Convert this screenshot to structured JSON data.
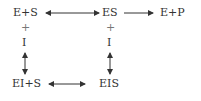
{
  "diagram": {
    "type": "enzyme inhibition reaction scheme",
    "nodes": {
      "e_plus_s": "E+S",
      "es": "ES",
      "e_plus_p": "E+P",
      "ei_plus_s": "EI+S",
      "eis": "EIS"
    },
    "left_column": {
      "plus": "+",
      "inhibitor": "I"
    },
    "right_column": {
      "plus": "+",
      "inhibitor": "I"
    },
    "edges": [
      {
        "from": "E+S",
        "to": "ES",
        "type": "reversible"
      },
      {
        "from": "ES",
        "to": "E+P",
        "type": "forward"
      },
      {
        "from": "E+S + I",
        "to": "EI+S",
        "type": "reversible"
      },
      {
        "from": "ES + I",
        "to": "EIS",
        "type": "reversible"
      },
      {
        "from": "EI+S",
        "to": "EIS",
        "type": "reversible"
      }
    ],
    "colors": {
      "text": "#333333",
      "arrow": "#333333"
    }
  }
}
